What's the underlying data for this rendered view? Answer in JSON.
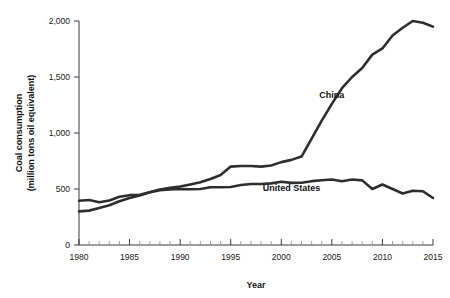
{
  "chart_data": {
    "type": "line",
    "title": "",
    "xlabel": "Year",
    "ylabel": "Coal consumption\n(million tons oil equivalent)",
    "ylabel_line1": "Coal consumption",
    "ylabel_line2": "(million tons oil equivalent)",
    "xlim": [
      1980,
      2015
    ],
    "ylim": [
      0,
      2000
    ],
    "grid": false,
    "legend_position": "inline-annotations",
    "y_ticks": [
      0,
      500,
      1000,
      1500,
      2000
    ],
    "y_tick_labels": [
      "0",
      "500",
      "1,000",
      "1,500",
      "2,000"
    ],
    "x_ticks": [
      1980,
      1985,
      1990,
      1995,
      2000,
      2005,
      2010,
      2015
    ],
    "x_tick_labels": [
      "1980",
      "1985",
      "1990",
      "1995",
      "2000",
      "2005",
      "2010",
      "2015"
    ],
    "x_minor_tick_interval": 1,
    "line_color": "#2e2e2e",
    "x": [
      1980,
      1981,
      1982,
      1983,
      1984,
      1985,
      1986,
      1987,
      1988,
      1989,
      1990,
      1991,
      1992,
      1993,
      1994,
      1995,
      1996,
      1997,
      1998,
      1999,
      2000,
      2001,
      2002,
      2003,
      2004,
      2005,
      2006,
      2007,
      2008,
      2009,
      2010,
      2011,
      2012,
      2013,
      2014,
      2015
    ],
    "series": [
      {
        "name": "China",
        "label": "China",
        "label_x": 2005,
        "label_y": 1310,
        "values": [
          300,
          307,
          330,
          355,
          390,
          420,
          443,
          470,
          495,
          510,
          522,
          540,
          560,
          590,
          625,
          700,
          705,
          705,
          700,
          710,
          740,
          760,
          790,
          950,
          1110,
          1260,
          1400,
          1500,
          1580,
          1700,
          1755,
          1870,
          1940,
          2000,
          1985,
          1950
        ]
      },
      {
        "name": "United States",
        "label": "United States",
        "label_x": 2001,
        "label_y": 480,
        "values": [
          395,
          402,
          382,
          398,
          430,
          445,
          448,
          470,
          490,
          497,
          500,
          498,
          500,
          515,
          515,
          518,
          535,
          545,
          545,
          550,
          565,
          555,
          556,
          570,
          578,
          585,
          570,
          585,
          577,
          500,
          540,
          500,
          460,
          485,
          480,
          420
        ]
      }
    ]
  }
}
